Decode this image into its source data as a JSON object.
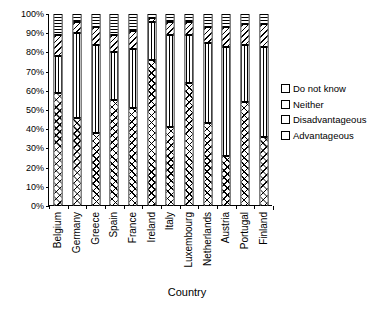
{
  "chart_data": {
    "type": "bar",
    "subtype": "stacked-100-percent",
    "title": "",
    "xlabel": "Country",
    "ylabel": "",
    "ylim": [
      0,
      100
    ],
    "ytick_labels": [
      "0%",
      "10%",
      "20%",
      "30%",
      "40%",
      "50%",
      "60%",
      "70%",
      "80%",
      "90%",
      "100%"
    ],
    "ytick_values": [
      0,
      10,
      20,
      30,
      40,
      50,
      60,
      70,
      80,
      90,
      100
    ],
    "grid": false,
    "legend_position": "right",
    "categories": [
      "Belgium",
      "Germany",
      "Greece",
      "Spain",
      "France",
      "Ireland",
      "Italy",
      "Luxembourg",
      "Netherlands",
      "Austria",
      "Portugal",
      "Finland"
    ],
    "series": [
      {
        "name": "Advantageous",
        "pattern": "diagonal-cross-hatch",
        "values": [
          59,
          46,
          38,
          55,
          51,
          76,
          41,
          64,
          43,
          26,
          54,
          36
        ]
      },
      {
        "name": "Disadvantageous",
        "pattern": "vertical-lines",
        "values": [
          19,
          44,
          46,
          25,
          31,
          20,
          48,
          25,
          42,
          57,
          30,
          47
        ]
      },
      {
        "name": "Neither",
        "pattern": "diagonal-lines",
        "values": [
          11,
          6,
          9,
          9,
          9,
          2,
          7,
          7,
          8,
          10,
          11,
          12
        ]
      },
      {
        "name": "Do not know",
        "pattern": "horizontal-lines",
        "values": [
          11,
          4,
          7,
          11,
          9,
          2,
          4,
          4,
          7,
          7,
          5,
          5
        ]
      }
    ],
    "stack_order_top_to_bottom": [
      "Do not know",
      "Neither",
      "Disadvantageous",
      "Advantageous"
    ],
    "legend_entries": [
      {
        "label": "Do not know",
        "pattern": "horizontal-lines"
      },
      {
        "label": "Neither",
        "pattern": "diagonal-lines"
      },
      {
        "label": "Disadvantageous",
        "pattern": "vertical-lines"
      },
      {
        "label": "Advantageous",
        "pattern": "diagonal-cross-hatch"
      }
    ]
  }
}
